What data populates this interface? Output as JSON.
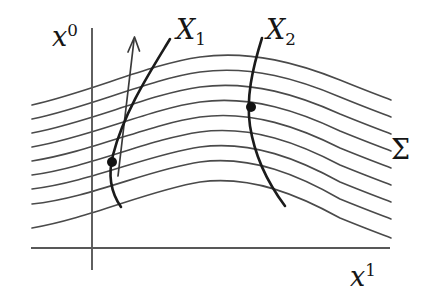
{
  "figure": {
    "kind": "spacetime-foliation-diagram",
    "background_color": "#ffffff",
    "width": 429,
    "height": 304,
    "axes": {
      "vertical": {
        "name": "x0-axis",
        "label_base": "x",
        "label_sup": "0",
        "color": "#585858",
        "x": 92,
        "y_top": 28,
        "y_bottom": 270
      },
      "horizontal": {
        "name": "x1-axis",
        "label_base": "x",
        "label_sup": "1",
        "color": "#585858",
        "y": 248,
        "x_left": 31,
        "x_right": 390
      }
    },
    "labels": {
      "x0": {
        "base": "x",
        "sup": "0"
      },
      "x1": {
        "base": "x",
        "sup": "1"
      },
      "X1": {
        "base": "X",
        "sub": "1"
      },
      "X2": {
        "base": "X",
        "sub": "2"
      },
      "sigma": "Σ"
    },
    "foliation": {
      "name": "sigma-family",
      "label": "Σ",
      "curve_count": 9,
      "color": "#4a4a4a",
      "stroke_width": 1.6,
      "left_x": 32,
      "right_x": 391,
      "peak_x": 233,
      "left_endpoints_y": [
        105,
        119,
        133,
        147,
        161,
        175,
        189,
        204,
        228
      ],
      "peak_y": [
        57,
        72,
        87,
        102,
        117,
        132,
        147,
        162,
        182
      ],
      "right_endpoints_y": [
        100,
        117,
        134,
        151,
        168,
        185,
        202,
        219,
        238
      ]
    },
    "worldlines": [
      {
        "name": "worldline-X1",
        "label_base": "X",
        "label_sub": "1",
        "color": "#1b1b1b",
        "top": {
          "x": 170,
          "y": 39
        },
        "bottom": {
          "x": 121,
          "y": 207
        },
        "event_dot": {
          "x": 112,
          "y": 162
        }
      },
      {
        "name": "worldline-X2",
        "label_base": "X",
        "label_sub": "2",
        "color": "#1b1b1b",
        "top": {
          "x": 262,
          "y": 38
        },
        "bottom": {
          "x": 285,
          "y": 206
        },
        "event_dot": {
          "x": 251,
          "y": 107
        }
      }
    ],
    "flow_arrow": {
      "name": "time-flow-arrow",
      "color": "#3a3a3a",
      "tail": {
        "x": 118,
        "y": 176
      },
      "head": {
        "x": 134,
        "y": 38
      }
    },
    "event_dots": [
      {
        "name": "event-dot-X1",
        "x": 112,
        "y": 162,
        "r": 5.0
      },
      {
        "name": "event-dot-X2",
        "x": 251,
        "y": 107,
        "r": 5.0
      }
    ]
  }
}
